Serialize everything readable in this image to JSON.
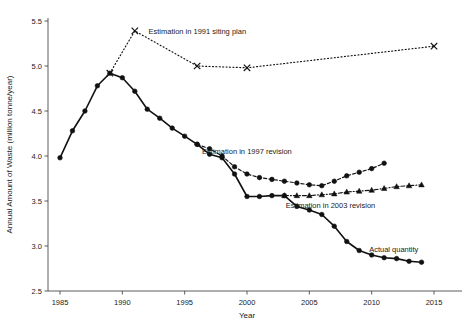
{
  "chart_data": {
    "type": "line",
    "title": "",
    "xlabel": "Year",
    "ylabel": "Annual Amount of Waste (million tonne/year)",
    "xlim": [
      1983.5,
      2016.5
    ],
    "ylim": [
      2.5,
      5.5
    ],
    "xticks": [
      1985,
      1990,
      1995,
      2000,
      2005,
      2010,
      2015
    ],
    "xtick_labels": [
      "1985",
      "1990",
      "1995",
      "2000",
      "2005",
      "2010",
      "2015"
    ],
    "yticks": [
      2.5,
      3.0,
      3.5,
      4.0,
      4.5,
      5.0,
      5.5
    ],
    "ytick_labels": [
      "2.5",
      "3.0",
      "3.5",
      "4.0",
      "4.5",
      "5.0",
      "5.5"
    ],
    "grid": false,
    "legend_position": "inline-annotations",
    "series": [
      {
        "name": "Actual quantity",
        "label": "Actual quantity",
        "label_x": 2009.8,
        "label_y": 2.93,
        "marker": "circle",
        "linestyle": "solid",
        "color": "#111111",
        "x": [
          1985,
          1986,
          1987,
          1988,
          1989,
          1990,
          1991,
          1992,
          1993,
          1994,
          1995,
          1996,
          1997,
          1998,
          1999,
          2000,
          2001,
          2002,
          2003,
          2004,
          2005,
          2006,
          2007,
          2008,
          2009,
          2010,
          2011,
          2012,
          2013,
          2014
        ],
        "values": [
          3.98,
          4.28,
          4.5,
          4.78,
          4.92,
          4.87,
          4.72,
          4.52,
          4.42,
          4.31,
          4.22,
          4.13,
          4.02,
          3.98,
          3.8,
          3.55,
          3.55,
          3.56,
          3.56,
          3.44,
          3.4,
          3.35,
          3.22,
          3.05,
          2.95,
          2.9,
          2.87,
          2.86,
          2.83,
          2.82
        ]
      },
      {
        "name": "Estimation in 1991 siting plan",
        "label": "Estimation in 1991 siting plan",
        "label_x": 1992.1,
        "label_y": 5.36,
        "marker": "x",
        "linestyle": "dotted",
        "color": "#111111",
        "x": [
          1989,
          1991,
          1996,
          2000,
          2015
        ],
        "values": [
          4.92,
          5.39,
          5.0,
          4.98,
          5.22
        ]
      },
      {
        "name": "Estimation in 1997 revision",
        "label": "Estimation in 1997 revision",
        "label_x": 1996.4,
        "label_y": 4.02,
        "marker": "circle",
        "linestyle": "dashed",
        "color": "#111111",
        "x": [
          1996,
          1997,
          1998,
          1999,
          2000,
          2001,
          2002,
          2003,
          2004,
          2005,
          2006,
          2007,
          2008,
          2009,
          2010,
          2011
        ],
        "values": [
          4.13,
          4.08,
          4.0,
          3.88,
          3.8,
          3.76,
          3.74,
          3.72,
          3.7,
          3.68,
          3.67,
          3.72,
          3.78,
          3.82,
          3.86,
          3.92
        ]
      },
      {
        "name": "Estimation in 2003 revision",
        "label": "Estimation in 2003 revision",
        "label_x": 2003.1,
        "label_y": 3.42,
        "marker": "triangle",
        "linestyle": "dashdot",
        "color": "#111111",
        "x": [
          2003,
          2004,
          2005,
          2006,
          2007,
          2008,
          2009,
          2010,
          2011,
          2012,
          2013,
          2014
        ],
        "values": [
          3.56,
          3.56,
          3.56,
          3.57,
          3.58,
          3.6,
          3.61,
          3.62,
          3.64,
          3.66,
          3.67,
          3.68
        ]
      }
    ]
  },
  "axes": {
    "xlabel": "Year",
    "ylabel": "Annual Amount of Waste (million tonne/year)"
  },
  "colors": {
    "ink": "#111111",
    "axis": "#4a4a4a",
    "background": "#ffffff"
  }
}
